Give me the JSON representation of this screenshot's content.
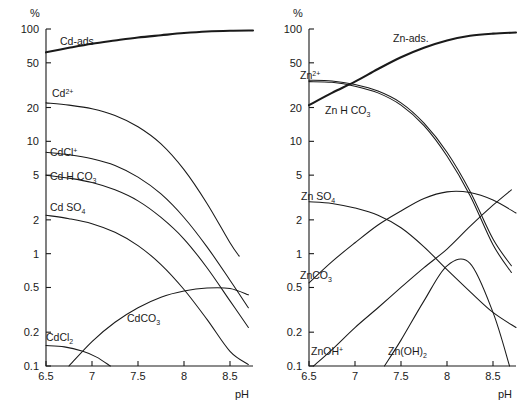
{
  "figure": {
    "background": "#ffffff",
    "ink": "#1a1a1a"
  },
  "panels": [
    {
      "id": "cadmium",
      "percent_symbol": "%",
      "xlabel": "pH",
      "ylabel": "%",
      "ytick_labels": [
        "100",
        "50",
        "20",
        "10",
        "5",
        "2",
        "1",
        "0.5",
        "0.2",
        "0.1"
      ],
      "xtick_labels": [
        "6.5",
        "7",
        "7.5",
        "8",
        "8.5"
      ],
      "curve_labels": [
        {
          "text": "Cd-ads",
          "x": 60,
          "y": 45
        },
        {
          "text": "Cd",
          "sup": "2+",
          "x": 52,
          "y": 97
        },
        {
          "text": "CdCl",
          "sup": "+",
          "x": 50,
          "y": 156
        },
        {
          "text": "Cd H CO",
          "sub": "3",
          "x": 50,
          "y": 180
        },
        {
          "text": "Cd SO",
          "sub": "4",
          "x": 50,
          "y": 211
        },
        {
          "text": "CdCO",
          "sub": "3",
          "x": 127,
          "y": 322
        },
        {
          "text": "CdCl",
          "sub": "2",
          "x": 46,
          "y": 341
        }
      ]
    },
    {
      "id": "zinc",
      "percent_symbol": "%",
      "xlabel": "pH",
      "ylabel": "%",
      "ytick_labels": [
        "100",
        "50",
        "20",
        "10",
        "5",
        "2",
        "1",
        "0.5",
        "0.2",
        "0.1"
      ],
      "xtick_labels": [
        "6.5",
        "7",
        "7.5",
        "8",
        "8.5"
      ],
      "curve_labels": [
        {
          "text": "Zn-ads.",
          "x": 130,
          "y": 42
        },
        {
          "text": "Zn",
          "sup": "2+",
          "x": 37,
          "y": 79
        },
        {
          "text": "Zn H CO",
          "sub": "3",
          "x": 62,
          "y": 114
        },
        {
          "text": "Zn SO",
          "sub": "4",
          "x": 38,
          "y": 200
        },
        {
          "text": "ZnCO",
          "sub": "3",
          "x": 37,
          "y": 279
        },
        {
          "text": "ZnOH",
          "sup": "+",
          "x": 48,
          "y": 355
        },
        {
          "text": "Zn(OH)",
          "sub": "2",
          "x": 125,
          "y": 355
        }
      ]
    }
  ],
  "chart_data": [
    {
      "type": "line",
      "id": "cadmium-speciation",
      "title": "Cd speciation and adsorption vs pH",
      "xlabel": "pH",
      "ylabel": "%",
      "yscale": "log",
      "ylim": [
        0.1,
        100
      ],
      "xlim": [
        6.5,
        8.75
      ],
      "ytick_values": [
        100,
        50,
        20,
        10,
        5,
        2,
        1,
        0.5,
        0.2,
        0.1
      ],
      "xtick_values": [
        6.5,
        7,
        7.5,
        8,
        8.5
      ],
      "grid": false,
      "legend": "inline-curve-labels",
      "series": [
        {
          "name": "Cd-ads",
          "emphasis": true,
          "x": [
            6.5,
            6.75,
            7.0,
            7.25,
            7.5,
            7.75,
            8.0,
            8.25,
            8.5,
            8.75
          ],
          "y": [
            62,
            68,
            74,
            79,
            84,
            88,
            92,
            95,
            96.5,
            97
          ]
        },
        {
          "name": "Cd2+",
          "x": [
            6.5,
            6.75,
            7.0,
            7.25,
            7.5,
            7.75,
            8.0,
            8.25,
            8.5,
            8.6
          ],
          "y": [
            22,
            21,
            19.5,
            17,
            13.5,
            9.5,
            5.6,
            2.8,
            1.25,
            0.95
          ]
        },
        {
          "name": "CdCl+",
          "x": [
            6.5,
            6.75,
            7.0,
            7.25,
            7.5,
            7.75,
            8.0,
            8.25,
            8.5,
            8.7
          ],
          "y": [
            8.0,
            7.6,
            7.0,
            6.1,
            4.8,
            3.4,
            2.1,
            1.15,
            0.58,
            0.33
          ]
        },
        {
          "name": "CdHCO3",
          "x": [
            6.5,
            6.75,
            7.0,
            7.25,
            7.5,
            7.75,
            8.0,
            8.25,
            8.5,
            8.7
          ],
          "y": [
            5.0,
            4.7,
            4.3,
            3.7,
            2.95,
            2.1,
            1.35,
            0.75,
            0.38,
            0.22
          ]
        },
        {
          "name": "CdSO4",
          "x": [
            6.5,
            6.75,
            7.0,
            7.25,
            7.5,
            7.75,
            8.0,
            8.25,
            8.5,
            8.7
          ],
          "y": [
            2.2,
            2.05,
            1.85,
            1.55,
            1.18,
            0.8,
            0.48,
            0.26,
            0.135,
            0.103
          ]
        },
        {
          "name": "CdCO3",
          "x": [
            6.75,
            7.0,
            7.25,
            7.5,
            7.75,
            8.0,
            8.25,
            8.5,
            8.7
          ],
          "y": [
            0.1,
            0.165,
            0.245,
            0.33,
            0.41,
            0.465,
            0.495,
            0.49,
            0.43
          ]
        },
        {
          "name": "CdCl2",
          "x": [
            6.5,
            6.7,
            6.9,
            7.05,
            7.2
          ],
          "y": [
            0.152,
            0.148,
            0.135,
            0.12,
            0.1
          ]
        }
      ]
    },
    {
      "type": "line",
      "id": "zinc-speciation",
      "title": "Zn speciation and adsorption vs pH",
      "xlabel": "pH",
      "ylabel": "%",
      "yscale": "log",
      "ylim": [
        0.1,
        100
      ],
      "xlim": [
        6.5,
        8.75
      ],
      "ytick_values": [
        100,
        50,
        20,
        10,
        5,
        2,
        1,
        0.5,
        0.2,
        0.1
      ],
      "xtick_values": [
        6.5,
        7,
        7.5,
        8,
        8.5
      ],
      "grid": false,
      "legend": "inline-curve-labels",
      "series": [
        {
          "name": "Zn-ads.",
          "emphasis": true,
          "x": [
            6.5,
            6.75,
            7.0,
            7.25,
            7.5,
            7.75,
            8.0,
            8.25,
            8.5,
            8.75
          ],
          "y": [
            21,
            27,
            34,
            44,
            56,
            68,
            79,
            87,
            91,
            93
          ]
        },
        {
          "name": "Zn2+",
          "x": [
            6.5,
            6.75,
            7.0,
            7.25,
            7.5,
            7.75,
            8.0,
            8.25,
            8.5,
            8.7
          ],
          "y": [
            35,
            34.5,
            32,
            28,
            22,
            14.5,
            8.0,
            3.6,
            1.35,
            0.78
          ]
        },
        {
          "name": "ZnHCO3",
          "x": [
            6.5,
            6.75,
            7.0,
            7.25,
            7.5,
            7.75,
            8.0,
            8.25,
            8.5,
            8.7
          ],
          "y": [
            34,
            33.5,
            31,
            27,
            21,
            13.8,
            7.4,
            3.3,
            1.2,
            0.68
          ]
        },
        {
          "name": "ZnSO4",
          "x": [
            6.5,
            6.75,
            7.0,
            7.25,
            7.5,
            7.75,
            8.0,
            8.25,
            8.5,
            8.75
          ],
          "y": [
            2.9,
            2.8,
            2.55,
            2.2,
            1.7,
            1.15,
            0.72,
            0.46,
            0.3,
            0.22
          ]
        },
        {
          "name": "ZnCO3",
          "x": [
            6.5,
            6.75,
            7.0,
            7.25,
            7.5,
            7.75,
            8.0,
            8.25,
            8.5,
            8.75
          ],
          "y": [
            0.55,
            0.85,
            1.25,
            1.8,
            2.4,
            3.1,
            3.55,
            3.5,
            3.0,
            2.3
          ]
        },
        {
          "name": "ZnOH+",
          "x": [
            6.55,
            6.75,
            7.0,
            7.25,
            7.5,
            7.75,
            8.0,
            8.25,
            8.5,
            8.7
          ],
          "y": [
            0.1,
            0.14,
            0.22,
            0.33,
            0.5,
            0.75,
            1.1,
            1.75,
            2.7,
            3.7
          ]
        },
        {
          "name": "Zn(OH)2",
          "x": [
            7.32,
            7.5,
            7.75,
            8.0,
            8.25,
            8.5,
            8.68
          ],
          "y": [
            0.1,
            0.17,
            0.38,
            0.78,
            0.82,
            0.3,
            0.1
          ]
        }
      ]
    }
  ]
}
